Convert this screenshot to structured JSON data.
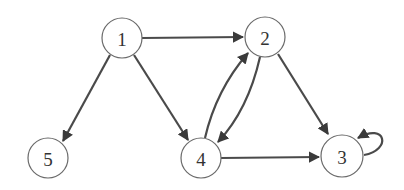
{
  "diagram": {
    "type": "directed-graph",
    "colors": {
      "background": "#ffffff",
      "node_stroke": "#6a6a6a",
      "node_fill": "#ffffff",
      "edge": "#4a4a4a",
      "label": "#333333"
    },
    "nodes": [
      {
        "id": "1",
        "label": "1",
        "x": 122,
        "y": 38,
        "r": 20
      },
      {
        "id": "2",
        "label": "2",
        "x": 265,
        "y": 37,
        "r": 20
      },
      {
        "id": "3",
        "label": "3",
        "x": 342,
        "y": 156,
        "r": 21
      },
      {
        "id": "4",
        "label": "4",
        "x": 201,
        "y": 158,
        "r": 20
      },
      {
        "id": "5",
        "label": "5",
        "x": 48,
        "y": 158,
        "r": 20
      }
    ],
    "edges": [
      {
        "from": "1",
        "to": "2"
      },
      {
        "from": "1",
        "to": "5"
      },
      {
        "from": "1",
        "to": "4"
      },
      {
        "from": "2",
        "to": "4"
      },
      {
        "from": "4",
        "to": "2"
      },
      {
        "from": "2",
        "to": "3"
      },
      {
        "from": "4",
        "to": "3"
      },
      {
        "from": "3",
        "to": "3",
        "self_loop": true
      }
    ]
  }
}
